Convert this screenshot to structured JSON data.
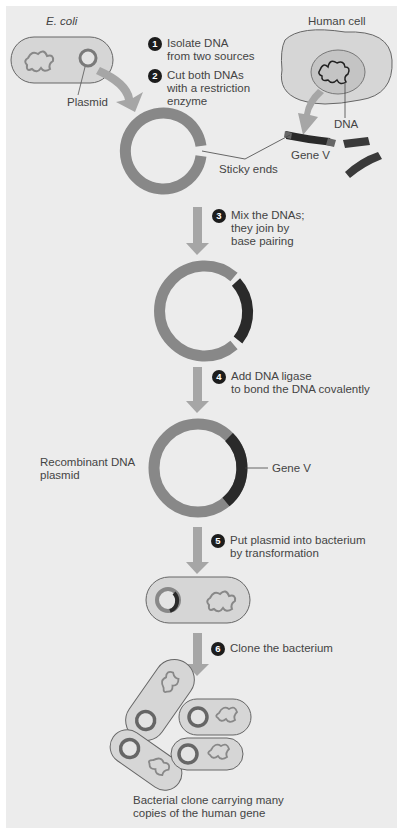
{
  "labels": {
    "ecoli": "E. coli",
    "human_cell": "Human cell",
    "plasmid": "Plasmid",
    "dna": "DNA",
    "gene_v_top": "Gene V",
    "sticky_ends": "Sticky ends",
    "recombinant": "Recombinant DNA\nplasmid",
    "gene_v_recombinant": "Gene V",
    "caption": "Bacterial clone carrying many\ncopies of the human gene"
  },
  "steps": [
    {
      "num": "1",
      "text": "Isolate DNA\nfrom two sources"
    },
    {
      "num": "2",
      "text": "Cut both DNAs\nwith a restriction\nenzyme"
    },
    {
      "num": "3",
      "text": "Mix the DNAs;\nthey join by\nbase pairing"
    },
    {
      "num": "4",
      "text": "Add DNA ligase\nto bond the DNA covalently"
    },
    {
      "num": "5",
      "text": "Put plasmid into bacterium\nby transformation"
    },
    {
      "num": "6",
      "text": "Clone the bacterium"
    }
  ],
  "colors": {
    "background": "#ececec",
    "cell_fill": "#d6d6d6",
    "plasmid_dna": "#8a8a8a",
    "human_gene": "#2a2a2a",
    "arrow": "#a6a6a6",
    "badge": "#1c1c1c"
  }
}
